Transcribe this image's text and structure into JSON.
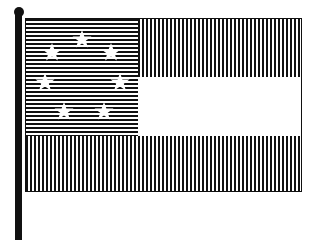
{
  "flag": {
    "name": "Stars and Bars",
    "stripes": [
      "red",
      "white",
      "red"
    ],
    "canton_color": "blue",
    "star_count": 7,
    "hatching": {
      "red": "vertical lines",
      "blue": "horizontal lines",
      "white": "plain"
    },
    "colors": {
      "ink": "#111111",
      "background": "#ffffff"
    }
  }
}
